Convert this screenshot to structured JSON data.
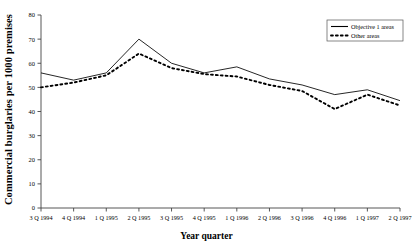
{
  "chart_data": {
    "type": "line",
    "title": "",
    "xlabel": "Year quarter",
    "ylabel": "Commercial burglaries per 1000 premises",
    "categories": [
      "3 Q 1994",
      "4 Q 1994",
      "1 Q 1995",
      "2 Q 1995",
      "3 Q 1995",
      "4 Q 1995",
      "1 Q 1996",
      "2 Q 1996",
      "3 Q 1996",
      "4 Q 1996",
      "1 Q 1997",
      "2 Q 1997"
    ],
    "series": [
      {
        "name": "Objective 1 areas",
        "style": "solid",
        "color": "#000000",
        "values": [
          56,
          53,
          56,
          70,
          60,
          56,
          58.5,
          53.5,
          51,
          47,
          49,
          44.5
        ]
      },
      {
        "name": "Other areas",
        "style": "dotted",
        "color": "#000000",
        "values": [
          50,
          52,
          55,
          64,
          58,
          55.5,
          54.5,
          51,
          48.5,
          41,
          47,
          42.5
        ]
      }
    ],
    "ylim": [
      0,
      80
    ],
    "yticks": [
      0,
      10,
      20,
      30,
      40,
      50,
      60,
      70,
      80
    ],
    "ytick_labels": [
      "0",
      "10",
      "20",
      "30",
      "40",
      "50",
      "60",
      "70",
      "80"
    ],
    "grid": false,
    "legend_position": "top-right",
    "legend_entries": [
      "Objective 1 areas",
      "Other areas"
    ]
  }
}
